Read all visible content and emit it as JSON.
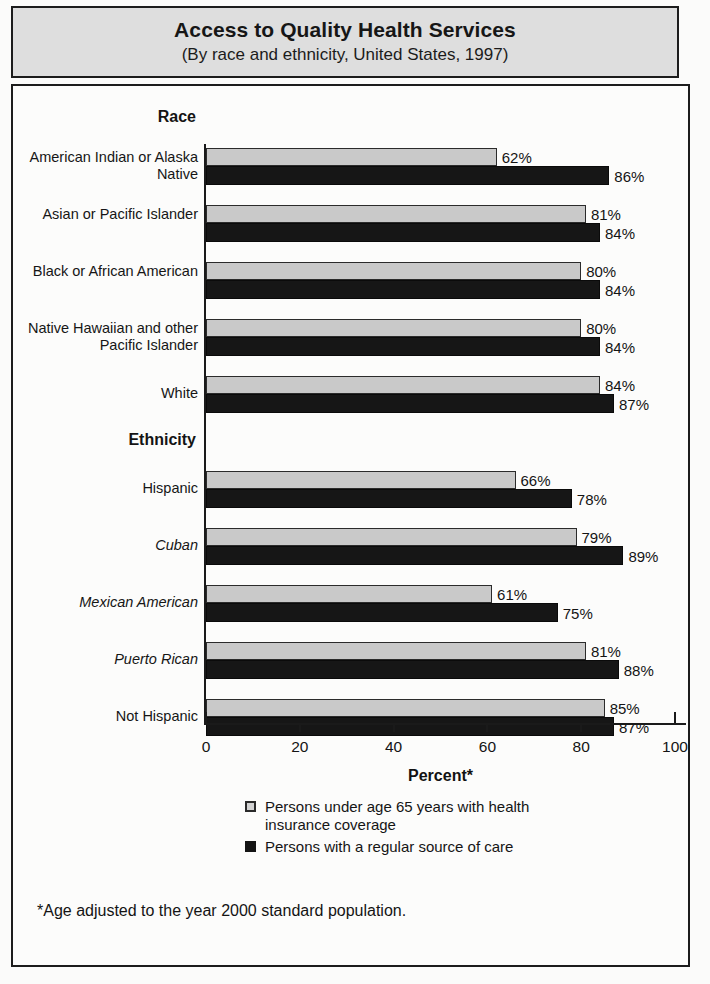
{
  "header": {
    "title": "Access to Quality Health Services",
    "subtitle": "(By race and ethnicity, United States, 1997)"
  },
  "sections": {
    "race_heading": "Race",
    "ethnicity_heading": "Ethnicity"
  },
  "legend": {
    "items": [
      {
        "swatch": "light",
        "label": "Persons under age 65 years with health insurance coverage"
      },
      {
        "swatch": "dark",
        "label": "Persons with a regular source of care"
      }
    ]
  },
  "footnote": "*Age adjusted to the year 2000 standard population.",
  "colors": {
    "insurance_bar": "#c9c9c9",
    "regular_care_bar": "#161616",
    "header_background": "#dedede",
    "frame": "#1c1c1c"
  },
  "chart_data": {
    "type": "bar",
    "orientation": "horizontal",
    "title": "Access to Quality Health Services",
    "subtitle": "(By race and ethnicity, United States, 1997)",
    "xlabel": "Percent*",
    "ylabel": "",
    "xlim": [
      0,
      100
    ],
    "xticks": [
      0,
      20,
      40,
      60,
      80,
      100
    ],
    "xtick_labels": [
      "0",
      "20",
      "40",
      "60",
      "80",
      "100"
    ],
    "grid": false,
    "legend_position": "bottom",
    "groups": [
      {
        "heading": "Race",
        "categories": [
          {
            "label": "American Indian or Alaska Native",
            "italic": false
          },
          {
            "label": "Asian or Pacific Islander",
            "italic": false
          },
          {
            "label": "Black or African American",
            "italic": false
          },
          {
            "label": "Native Hawaiian and other Pacific Islander",
            "italic": false
          },
          {
            "label": "White",
            "italic": false
          }
        ],
        "series": [
          {
            "name": "Persons under age 65 years with health insurance coverage",
            "values": [
              62,
              81,
              80,
              80,
              84
            ],
            "value_labels": [
              "62%",
              "81%",
              "80%",
              "80%",
              "84%"
            ]
          },
          {
            "name": "Persons with a regular source of care",
            "values": [
              86,
              84,
              84,
              84,
              87
            ],
            "value_labels": [
              "86%",
              "84%",
              "84%",
              "84%",
              "87%"
            ]
          }
        ]
      },
      {
        "heading": "Ethnicity",
        "categories": [
          {
            "label": "Hispanic",
            "italic": false
          },
          {
            "label": "Cuban",
            "italic": true
          },
          {
            "label": "Mexican American",
            "italic": true
          },
          {
            "label": "Puerto Rican",
            "italic": true
          },
          {
            "label": "Not Hispanic",
            "italic": false
          }
        ],
        "series": [
          {
            "name": "Persons under age 65 years with health insurance coverage",
            "values": [
              66,
              79,
              61,
              81,
              85
            ],
            "value_labels": [
              "66%",
              "79%",
              "61%",
              "81%",
              "85%"
            ]
          },
          {
            "name": "Persons with a regular source of care",
            "values": [
              78,
              89,
              75,
              88,
              87
            ],
            "value_labels": [
              "78%",
              "89%",
              "75%",
              "88%",
              "87%"
            ]
          }
        ]
      }
    ]
  }
}
